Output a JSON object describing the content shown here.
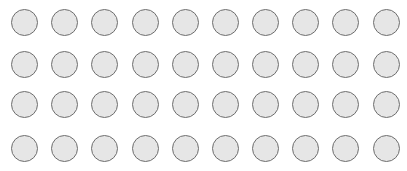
{
  "grid": {
    "rows": 4,
    "columns": 10,
    "circle_fill": "#e6e6e6",
    "circle_border": "#6e6e6e",
    "circle_diameter": 27,
    "col_centers": [
      24.5,
      64.7,
      104.8,
      145.0,
      185.2,
      225.3,
      265.5,
      305.7,
      345.8,
      386.0
    ],
    "row_centers": [
      22.5,
      64.0,
      104.5,
      148.0
    ]
  }
}
